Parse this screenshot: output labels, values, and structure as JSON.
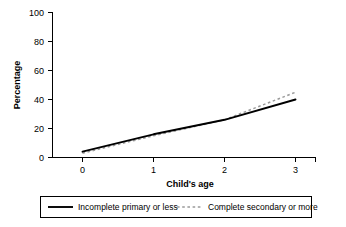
{
  "chart_data": {
    "type": "line",
    "title": "",
    "xlabel": "Child's age",
    "ylabel": "Percentage",
    "x": [
      0,
      1,
      2,
      3
    ],
    "xlim": [
      -0.18,
      3.28
    ],
    "ylim": [
      0,
      100
    ],
    "xticks": [
      "0",
      "1",
      "2",
      "3"
    ],
    "yticks": [
      "0",
      "20",
      "40",
      "60",
      "80",
      "100"
    ],
    "grid": false,
    "legend_position": "bottom",
    "series": [
      {
        "name": "Incomplete primary or less",
        "style": "solid",
        "color": "#000000",
        "values": [
          4,
          16,
          26,
          40
        ]
      },
      {
        "name": "Complete secondary or more",
        "style": "dotted",
        "color": "#9a9a9a",
        "values": [
          3,
          15,
          26,
          45
        ]
      }
    ]
  },
  "axes": {
    "y_title": "Percentage",
    "x_title": "Child's age",
    "y_tick_0": "0",
    "y_tick_20": "20",
    "y_tick_40": "40",
    "y_tick_60": "60",
    "y_tick_80": "80",
    "y_tick_100": "100",
    "x_tick_0": "0",
    "x_tick_1": "1",
    "x_tick_2": "2",
    "x_tick_3": "3"
  },
  "legend": {
    "entry_1_label": "Incomplete primary or less",
    "entry_2_label": "Complete secondary or more"
  }
}
